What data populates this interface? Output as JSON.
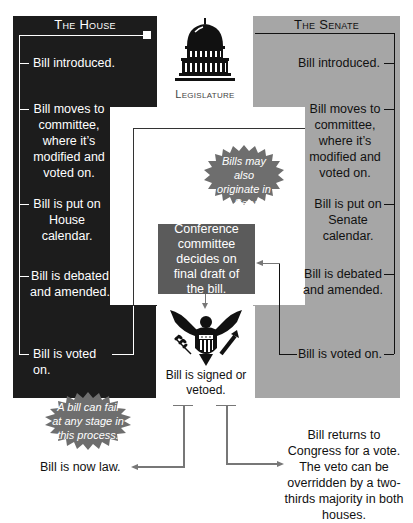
{
  "colors": {
    "house_bg": "#1c1c1c",
    "senate_bg": "#a6a6a6",
    "conference_bg": "#5b5b5b",
    "burst_bg": "#6e6e6e",
    "arrow": "#777777"
  },
  "house": {
    "title": "The House",
    "steps": [
      {
        "label": "Bill introduced."
      },
      {
        "label": "Bill moves to committee, where it’s modified and voted on."
      },
      {
        "label": "Bill is put on House calendar."
      },
      {
        "label": "Bill is debated and amended."
      },
      {
        "label": "Bill is voted on."
      }
    ]
  },
  "senate": {
    "title": "The Senate",
    "steps": [
      {
        "label": "Bill introduced."
      },
      {
        "label": "Bill moves to committee, where it’s modified and voted on."
      },
      {
        "label": "Bill is put on Senate calendar."
      },
      {
        "label": "Bill is debated and amended."
      },
      {
        "label": "Bill is voted on."
      }
    ]
  },
  "legislature": {
    "icon": "capitol-dome-icon",
    "label": "Legislature"
  },
  "notes": {
    "originate": "Bills may also originate in the Senate.",
    "fail": "A bill can fail at any stage in this process."
  },
  "conference": {
    "label": "Conference committee decides on final draft of the bill."
  },
  "president": {
    "icon": "presidential-eagle-seal-icon",
    "label": "Bill is signed or vetoed."
  },
  "outcomes": {
    "law": "Bill is now law.",
    "veto": "Bill returns to Congress for a vote. The veto can be overridden by a two-thirds majority in both houses."
  }
}
